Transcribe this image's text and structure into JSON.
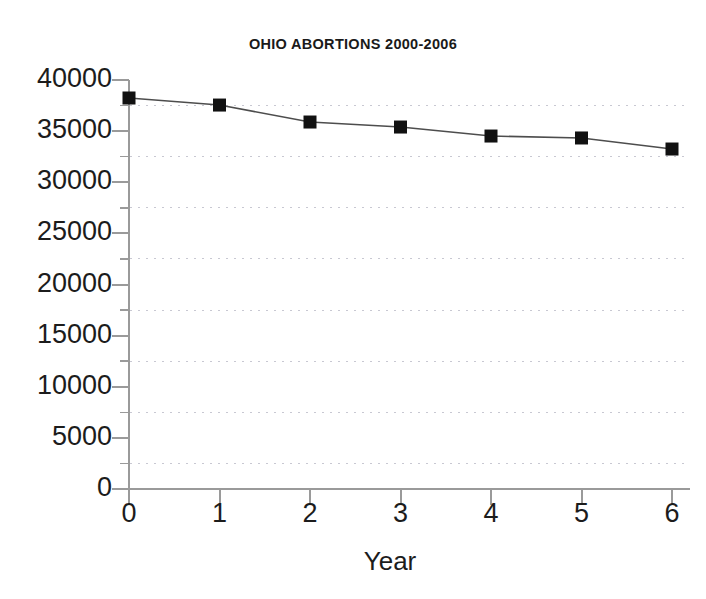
{
  "chart_data": {
    "type": "line",
    "title": "OHIO ABORTIONS 2000-2006",
    "xlabel": "Year",
    "ylabel": "",
    "x": [
      0,
      1,
      2,
      3,
      4,
      5,
      6
    ],
    "values": [
      38240,
      37550,
      35890,
      35400,
      34520,
      34330,
      33250
    ],
    "series": [
      {
        "name": "Ohio abortions",
        "values": [
          38240,
          37550,
          35890,
          35400,
          34520,
          34330,
          33250
        ]
      }
    ],
    "xlim": [
      0,
      6
    ],
    "ylim": [
      0,
      40000
    ],
    "x_tick_labels": [
      "0",
      "1",
      "2",
      "3",
      "4",
      "5",
      "6"
    ],
    "y_tick_labels": [
      "40000",
      "35000",
      "30000",
      "25000",
      "20000",
      "15000",
      "10000",
      "5000",
      "0"
    ],
    "y_tick_values": [
      40000,
      35000,
      30000,
      25000,
      20000,
      15000,
      10000,
      5000,
      0
    ],
    "y_minor_tick_values": [
      37500,
      32500,
      27500,
      22500,
      17500,
      12500,
      7500,
      2500
    ],
    "gridlines": {
      "horizontal": true,
      "vertical": false,
      "style": "dotted",
      "at_values": [
        37500,
        32500,
        27500,
        22500,
        17500,
        12500,
        7500,
        2500
      ]
    },
    "legend": null,
    "legend_position": "none",
    "marker": "square",
    "marker_color": "#111111",
    "line_color": "#4d4d4d",
    "grid_color": "#c8c8d2",
    "axis_color": "#9a9a9a",
    "text_color": "#1c1c1c",
    "background": "#ffffff"
  }
}
